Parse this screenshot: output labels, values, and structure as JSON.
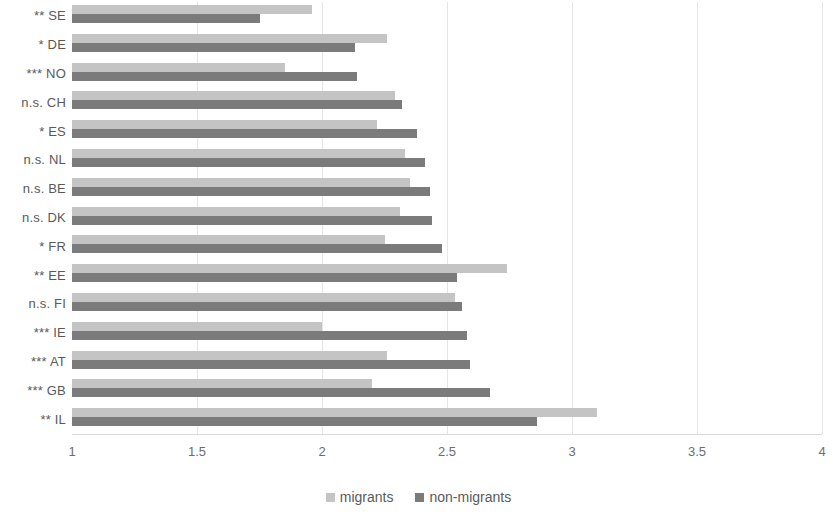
{
  "chart_data": {
    "type": "bar",
    "orientation": "horizontal",
    "title": "",
    "subtitle": "",
    "xlabel": "",
    "ylabel": "",
    "xlim": [
      1,
      4
    ],
    "xticks": [
      "1",
      "1.5",
      "2",
      "2.5",
      "3",
      "3.5",
      "4"
    ],
    "xtick_values": [
      1,
      1.5,
      2,
      2.5,
      3,
      3.5,
      4
    ],
    "grid": true,
    "legend_position": "bottom",
    "categories": [
      "** SE",
      "* DE",
      "*** NO",
      "n.s. CH",
      "* ES",
      "n.s. NL",
      "n.s. BE",
      "n.s. DK",
      "* FR",
      "** EE",
      "n.s. FI",
      "*** IE",
      "*** AT",
      "*** GB",
      "** IL"
    ],
    "series": [
      {
        "name": "migrants",
        "color": "#c4c4c4",
        "values": [
          1.96,
          2.26,
          1.85,
          2.29,
          2.22,
          2.33,
          2.35,
          2.31,
          2.25,
          2.74,
          2.53,
          2.0,
          2.26,
          2.2,
          3.1
        ]
      },
      {
        "name": "non-migrants",
        "color": "#7b7b7b",
        "values": [
          1.75,
          2.13,
          2.14,
          2.32,
          2.38,
          2.41,
          2.43,
          2.44,
          2.48,
          2.54,
          2.56,
          2.58,
          2.59,
          2.67,
          2.86
        ]
      }
    ]
  },
  "legend": {
    "items": [
      {
        "label": "migrants",
        "swatch": "migrants-swatch"
      },
      {
        "label": "non-migrants",
        "swatch": "non-migrants-swatch"
      }
    ]
  }
}
